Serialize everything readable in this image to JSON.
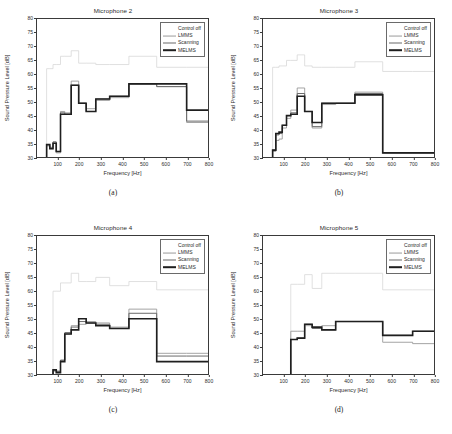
{
  "figure": {
    "background": "#ffffff",
    "axis_color": "#3a3a3a"
  },
  "legend": {
    "entries": [
      {
        "label": "Control off",
        "color": "#d8d8d8",
        "width": 0.8
      },
      {
        "label": "LMMS",
        "color": "#9a9a9a",
        "width": 0.9
      },
      {
        "label": "Scanning",
        "color": "#6a6a6a",
        "width": 1.0
      },
      {
        "label": "MELMS",
        "color": "#1f1f1f",
        "width": 1.6
      }
    ]
  },
  "axes_common": {
    "xlabel": "Frequency [Hz]",
    "ylabel": "Sound Pressure Level [dB]",
    "xlim": [
      0,
      800
    ],
    "ylim": [
      30,
      80
    ],
    "xticks": [
      100,
      200,
      300,
      400,
      500,
      600,
      700,
      800
    ],
    "yticks": [
      30,
      35,
      40,
      45,
      50,
      55,
      60,
      65,
      70,
      75,
      80
    ],
    "grid": false
  },
  "panels": [
    {
      "key": "a",
      "title": "Microphone 2",
      "caption": "(a)"
    },
    {
      "key": "b",
      "title": "Microphone 3",
      "caption": "(b)"
    },
    {
      "key": "c",
      "title": "Microphone 4",
      "caption": "(c)"
    },
    {
      "key": "d",
      "title": "Microphone 5",
      "caption": "(d)"
    }
  ],
  "chart_data": [
    {
      "type": "line",
      "title": "Microphone 2",
      "subcaption": "(a)",
      "xlabel": "Frequency [Hz]",
      "ylabel": "Sound Pressure Level [dB]",
      "xlim": [
        0,
        800
      ],
      "ylim": [
        30,
        80
      ],
      "xticks": [
        100,
        200,
        300,
        400,
        500,
        600,
        700,
        800
      ],
      "yticks": [
        30,
        35,
        40,
        45,
        50,
        55,
        60,
        65,
        70,
        75,
        80
      ],
      "grid": false,
      "step": "post",
      "band_edges": [
        45,
        60,
        75,
        90,
        110,
        130,
        160,
        195,
        230,
        275,
        340,
        430,
        560,
        700,
        800
      ],
      "series": [
        {
          "name": "Control off",
          "color": "#d8d8d8",
          "values": [
            62,
            62,
            63.5,
            63.5,
            66.5,
            66.5,
            68.5,
            64,
            64,
            63.5,
            63.5,
            66.5,
            62.5,
            62.5
          ]
        },
        {
          "name": "LMMS",
          "color": "#9a9a9a",
          "values": [
            34,
            33,
            35,
            31.5,
            46.5,
            46,
            57.5,
            49.5,
            47.5,
            50.5,
            51.5,
            56.5,
            55.5,
            42.5
          ]
        },
        {
          "name": "Scanning",
          "color": "#6a6a6a",
          "values": [
            34.5,
            33.5,
            35.5,
            32,
            46,
            45.5,
            56,
            49.5,
            46.5,
            51,
            52,
            56.5,
            55.5,
            43
          ]
        },
        {
          "name": "MELMS",
          "color": "#1f1f1f",
          "values": [
            34.5,
            33,
            35,
            32,
            45.5,
            45.5,
            56,
            49.5,
            46.5,
            51,
            52,
            56.5,
            56.5,
            47
          ]
        }
      ]
    },
    {
      "type": "line",
      "title": "Microphone 3",
      "subcaption": "(b)",
      "xlabel": "Frequency [Hz]",
      "ylabel": "Sound Pressure Level [dB]",
      "xlim": [
        0,
        800
      ],
      "ylim": [
        30,
        80
      ],
      "xticks": [
        100,
        200,
        300,
        400,
        500,
        600,
        700,
        800
      ],
      "yticks": [
        30,
        35,
        40,
        45,
        50,
        55,
        60,
        65,
        70,
        75,
        80
      ],
      "grid": false,
      "step": "post",
      "band_edges": [
        45,
        60,
        75,
        90,
        110,
        130,
        160,
        195,
        230,
        275,
        340,
        430,
        560,
        700,
        800
      ],
      "series": [
        {
          "name": "Control off",
          "color": "#d8d8d8",
          "values": [
            62.5,
            62.5,
            63,
            63,
            65,
            65,
            67,
            63,
            62.5,
            62.5,
            62.5,
            64.5,
            61,
            61
          ]
        },
        {
          "name": "LMMS",
          "color": "#9a9a9a",
          "values": [
            32,
            36,
            36.5,
            40.5,
            44,
            47,
            55,
            46.5,
            40.5,
            49,
            49.5,
            53.5,
            31.5,
            31.5
          ]
        },
        {
          "name": "Scanning",
          "color": "#6a6a6a",
          "values": [
            32.5,
            38,
            38.5,
            41.5,
            45,
            46,
            53,
            46.5,
            41,
            49.5,
            49.5,
            53,
            31.5,
            31.5
          ]
        },
        {
          "name": "MELMS",
          "color": "#1f1f1f",
          "values": [
            32.5,
            38.5,
            39,
            41.5,
            45,
            45.5,
            52,
            46.5,
            42.5,
            49.5,
            49.5,
            52.5,
            31.5,
            31.5
          ]
        }
      ]
    },
    {
      "type": "line",
      "title": "Microphone 4",
      "subcaption": "(c)",
      "xlabel": "Frequency [Hz]",
      "ylabel": "Sound Pressure Level [dB]",
      "xlim": [
        0,
        800
      ],
      "ylim": [
        30,
        80
      ],
      "xticks": [
        100,
        200,
        300,
        400,
        500,
        600,
        700,
        800
      ],
      "yticks": [
        30,
        35,
        40,
        45,
        50,
        55,
        60,
        65,
        70,
        75,
        80
      ],
      "grid": false,
      "step": "post",
      "band_edges": [
        75,
        90,
        110,
        130,
        160,
        195,
        230,
        275,
        340,
        430,
        560,
        700,
        800
      ],
      "series": [
        {
          "name": "Control off",
          "color": "#d8d8d8",
          "values": [
            60,
            60,
            63,
            63,
            66.5,
            63.5,
            63.5,
            65,
            62,
            63.5,
            60.5,
            60.5
          ]
        },
        {
          "name": "LMMS",
          "color": "#9a9a9a",
          "values": [
            31,
            31,
            35,
            44.5,
            47.5,
            48,
            49,
            48.5,
            47,
            53.5,
            37.5,
            37.5
          ]
        },
        {
          "name": "Scanning",
          "color": "#6a6a6a",
          "values": [
            31.5,
            31,
            35,
            45,
            47,
            49,
            48.5,
            48,
            46.5,
            52,
            36.5,
            36.5
          ]
        },
        {
          "name": "MELMS",
          "color": "#1f1f1f",
          "values": [
            31.5,
            30.5,
            34.5,
            44.5,
            46,
            50,
            48.5,
            47.5,
            46.5,
            50,
            34.5,
            34.5
          ]
        }
      ]
    },
    {
      "type": "line",
      "title": "Microphone 5",
      "subcaption": "(d)",
      "xlabel": "Frequency [Hz]",
      "ylabel": "Sound Pressure Level [dB]",
      "xlim": [
        0,
        800
      ],
      "ylim": [
        30,
        80
      ],
      "xticks": [
        100,
        200,
        300,
        400,
        500,
        600,
        700,
        800
      ],
      "yticks": [
        30,
        35,
        40,
        45,
        50,
        55,
        60,
        65,
        70,
        75,
        80
      ],
      "grid": false,
      "step": "post",
      "band_edges": [
        130,
        160,
        195,
        230,
        275,
        340,
        430,
        560,
        700,
        800
      ],
      "series": [
        {
          "name": "Control off",
          "color": "#d8d8d8",
          "values": [
            62.5,
            62.5,
            66,
            61,
            66.5,
            66.5,
            66.5,
            60.5,
            60.5
          ]
        },
        {
          "name": "LMMS",
          "color": "#9a9a9a",
          "values": [
            45.5,
            45.5,
            47.5,
            46.5,
            47.5,
            49,
            49,
            41.5,
            41
          ]
        },
        {
          "name": "Scanning",
          "color": "#6a6a6a",
          "values": [
            42.5,
            43,
            48,
            46.5,
            46,
            49,
            49,
            44,
            45.5
          ]
        },
        {
          "name": "MELMS",
          "color": "#1f1f1f",
          "values": [
            42.5,
            43,
            48,
            47,
            46,
            49,
            49,
            44,
            45.5
          ]
        }
      ]
    }
  ]
}
